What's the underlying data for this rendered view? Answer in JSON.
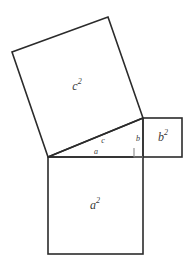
{
  "figure": {
    "background_color": "#ffffff",
    "stroke_color": "#2b2b2b",
    "label_color": "#3a3a3a",
    "right_angle_color": "#8a8a8a"
  },
  "labels": {
    "square_a": {
      "base": "a",
      "exponent": "2",
      "full": "a2"
    },
    "square_b": {
      "base": "b",
      "exponent": "2",
      "full": "b2"
    },
    "square_c": {
      "base": "c",
      "exponent": "2",
      "full": "c2"
    },
    "side_a": "a",
    "side_b": "b",
    "side_c": "c"
  },
  "geometry": {
    "triangle": {
      "vertex_left": {
        "x": 48,
        "y": 157
      },
      "vertex_right": {
        "x": 143,
        "y": 157
      },
      "vertex_top": {
        "x": 143,
        "y": 118
      }
    },
    "square_a": {
      "x": 48,
      "y": 157,
      "width": 95,
      "height": 97
    },
    "square_b": {
      "x": 143,
      "y": 118,
      "width": 39,
      "height": 39
    },
    "square_c": {
      "points": [
        {
          "x": 48,
          "y": 157
        },
        {
          "x": 12,
          "y": 52
        },
        {
          "x": 108,
          "y": 17
        },
        {
          "x": 143,
          "y": 118
        }
      ]
    },
    "right_angle_marker": {
      "x": 134,
      "y": 148,
      "size": 9
    },
    "label_positions": {
      "square_a": {
        "x": 95,
        "y": 206
      },
      "square_b": {
        "x": 163,
        "y": 138
      },
      "square_c": {
        "x": 77,
        "y": 87
      },
      "side_a": {
        "x": 96,
        "y": 152
      },
      "side_b": {
        "x": 138,
        "y": 139
      },
      "side_c": {
        "x": 103,
        "y": 141
      }
    }
  }
}
